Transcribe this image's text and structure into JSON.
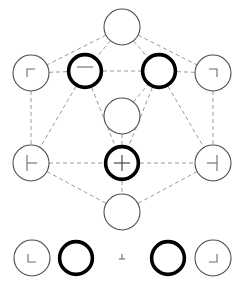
{
  "figure": {
    "title": "",
    "width": 244,
    "height": 282,
    "background": "#ffffff"
  },
  "style": {
    "edge_color": "#9a9a9a",
    "edge_width": 1.0,
    "edge_dash": "4 3",
    "node_fill": "#ffffff",
    "node_stroke_thin": "#4d4d4d",
    "node_stroke_bold": "#000000",
    "node_width_thin": 1.1,
    "node_width_bold": 3.6,
    "mark_color": "#6b6b6b",
    "mark_color_bold": "#3a3a3a"
  },
  "graph": {
    "nodes": [
      {
        "id": "n-top",
        "label": "",
        "cx": 122,
        "cy": 27,
        "r": 18,
        "emphasis": "thin",
        "mark": "none",
        "mark_name": "no-inner-mark"
      },
      {
        "id": "n-upper-left",
        "label": "",
        "cx": 31,
        "cy": 73,
        "r": 18,
        "emphasis": "thin",
        "mark": "corner-tl",
        "mark_name": "corner-top-left-mark"
      },
      {
        "id": "n-upper-mid-l",
        "label": "",
        "cx": 85,
        "cy": 71,
        "r": 18,
        "emphasis": "bold",
        "mark": "tick-top",
        "mark_name": "tick-top-mark"
      },
      {
        "id": "n-upper-mid-r",
        "label": "",
        "cx": 159,
        "cy": 71,
        "r": 18,
        "emphasis": "bold",
        "mark": "none",
        "mark_name": "no-inner-mark"
      },
      {
        "id": "n-upper-right",
        "label": "",
        "cx": 213,
        "cy": 73,
        "r": 18,
        "emphasis": "thin",
        "mark": "corner-tr",
        "mark_name": "corner-top-right-mark"
      },
      {
        "id": "n-center",
        "label": "",
        "cx": 122,
        "cy": 116,
        "r": 18,
        "emphasis": "thin",
        "mark": "none",
        "mark_name": "no-inner-mark"
      },
      {
        "id": "n-lower-left",
        "label": "",
        "cx": 31,
        "cy": 163,
        "r": 18,
        "emphasis": "thin",
        "mark": "tee-left",
        "mark_name": "tee-left-mark"
      },
      {
        "id": "n-lower-center",
        "label": "",
        "cx": 122,
        "cy": 163,
        "r": 18,
        "emphasis": "bold",
        "mark": "cross",
        "mark_name": "cross-mark"
      },
      {
        "id": "n-lower-right",
        "label": "",
        "cx": 213,
        "cy": 163,
        "r": 18,
        "emphasis": "thin",
        "mark": "tee-right",
        "mark_name": "tee-right-mark"
      },
      {
        "id": "n-bottom",
        "label": "",
        "cx": 122,
        "cy": 212,
        "r": 18,
        "emphasis": "thin",
        "mark": "none",
        "mark_name": "no-inner-mark"
      }
    ],
    "edges": [
      {
        "from": "n-top",
        "to": "n-upper-left"
      },
      {
        "from": "n-top",
        "to": "n-upper-mid-l"
      },
      {
        "from": "n-top",
        "to": "n-upper-mid-r"
      },
      {
        "from": "n-top",
        "to": "n-upper-right"
      },
      {
        "from": "n-upper-left",
        "to": "n-upper-mid-l"
      },
      {
        "from": "n-upper-mid-l",
        "to": "n-upper-mid-r"
      },
      {
        "from": "n-upper-mid-r",
        "to": "n-upper-right"
      },
      {
        "from": "n-upper-left",
        "to": "n-lower-left"
      },
      {
        "from": "n-upper-right",
        "to": "n-lower-right"
      },
      {
        "from": "n-upper-mid-l",
        "to": "n-lower-left"
      },
      {
        "from": "n-upper-mid-l",
        "to": "n-lower-center"
      },
      {
        "from": "n-upper-mid-r",
        "to": "n-lower-center"
      },
      {
        "from": "n-upper-mid-r",
        "to": "n-lower-right"
      },
      {
        "from": "n-center",
        "to": "n-lower-center"
      },
      {
        "from": "n-center",
        "to": "n-upper-mid-r"
      },
      {
        "from": "n-lower-left",
        "to": "n-lower-center"
      },
      {
        "from": "n-lower-center",
        "to": "n-lower-right"
      },
      {
        "from": "n-lower-left",
        "to": "n-bottom"
      },
      {
        "from": "n-lower-center",
        "to": "n-bottom"
      },
      {
        "from": "n-lower-right",
        "to": "n-bottom"
      }
    ]
  },
  "legend": {
    "items": [
      {
        "id": "lg-1",
        "label": "",
        "cx": 32,
        "cy": 258,
        "r": 18,
        "kind": "circle",
        "emphasis": "thin",
        "mark": "corner-bl",
        "mark_name": "corner-bottom-left-mark"
      },
      {
        "id": "lg-2",
        "label": "",
        "cx": 76,
        "cy": 258,
        "r": 18,
        "kind": "circle",
        "emphasis": "bold",
        "mark": "none",
        "mark_name": "no-inner-mark"
      },
      {
        "id": "lg-3",
        "label": "",
        "cx": 122,
        "cy": 258,
        "r": 6,
        "kind": "glyph",
        "emphasis": "thin",
        "mark": "tee-up",
        "mark_name": "tee-up-mark"
      },
      {
        "id": "lg-4",
        "label": "",
        "cx": 168,
        "cy": 258,
        "r": 18,
        "kind": "circle",
        "emphasis": "bold",
        "mark": "none",
        "mark_name": "no-inner-mark"
      },
      {
        "id": "lg-5",
        "label": "",
        "cx": 213,
        "cy": 258,
        "r": 18,
        "kind": "circle",
        "emphasis": "thin",
        "mark": "corner-br",
        "mark_name": "corner-bottom-right-mark"
      }
    ]
  }
}
